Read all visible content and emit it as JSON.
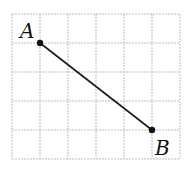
{
  "diagram": {
    "grid": {
      "cols": 6,
      "rows": 5,
      "x0": 12,
      "y0": 14,
      "cell_w": 28,
      "cell_h": 29,
      "line_color": "#bdbdbd"
    },
    "points": [
      {
        "label": "A",
        "col": 1,
        "row": 1,
        "label_x": 20,
        "label_y": 38
      },
      {
        "label": "B",
        "col": 5,
        "row": 4,
        "label_x": 155,
        "label_y": 155
      }
    ],
    "segment": {
      "from": "A",
      "to": "B",
      "color": "#1a1a1a"
    }
  }
}
